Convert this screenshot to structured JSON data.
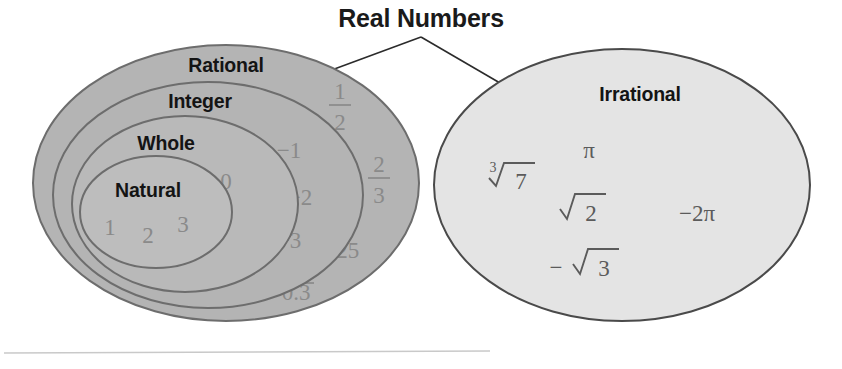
{
  "title": "Real Numbers",
  "colors": {
    "rational_fill": "#b4b4b4",
    "integer_fill": "#b4b4b4",
    "whole_fill": "#b9b9b9",
    "natural_fill": "#bdbdbd",
    "irrational_fill": "#e4e4e4",
    "ellipse_stroke": "#6d6d6d",
    "irrational_stroke": "#4a4a4a",
    "label_color": "#141414",
    "member_color": "#8a8a8a",
    "irrational_member_color": "#5b5b5b",
    "connector_color": "#2b2b2b",
    "rule_color": "#c9c9c9",
    "background": "#ffffff"
  },
  "sets": {
    "rational": {
      "label": "Rational",
      "members": [
        {
          "display": "1/2",
          "numerator": "1",
          "denominator": "2",
          "kind": "fraction"
        },
        {
          "display": "-2/3",
          "sign": "−",
          "numerator": "2",
          "denominator": "3",
          "kind": "fraction"
        },
        {
          "display": "2.25",
          "kind": "decimal"
        },
        {
          "display": "0.3",
          "repeating_digit": "3",
          "kind": "repeating-decimal"
        }
      ]
    },
    "integer": {
      "label": "Integer",
      "members": [
        {
          "display": "−1",
          "kind": "integer"
        },
        {
          "display": "−2",
          "kind": "integer"
        },
        {
          "display": "−3",
          "kind": "integer"
        }
      ]
    },
    "whole": {
      "label": "Whole",
      "members": [
        {
          "display": "0",
          "kind": "integer"
        }
      ]
    },
    "natural": {
      "label": "Natural",
      "members": [
        {
          "display": "1",
          "kind": "integer"
        },
        {
          "display": "2",
          "kind": "integer"
        },
        {
          "display": "3",
          "kind": "integer"
        }
      ]
    },
    "irrational": {
      "label": "Irrational",
      "members": [
        {
          "display": "cube root of 7",
          "index": "3",
          "radicand": "7",
          "kind": "radical"
        },
        {
          "display": "π",
          "kind": "constant"
        },
        {
          "display": "square root of 2",
          "radicand": "2",
          "kind": "radical"
        },
        {
          "display": "−2π",
          "kind": "constant-expression"
        },
        {
          "display": "negative square root of 3",
          "sign": "−",
          "radicand": "3",
          "kind": "radical"
        }
      ]
    }
  }
}
